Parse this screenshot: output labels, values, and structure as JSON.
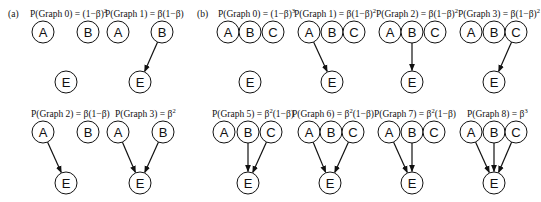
{
  "panels": [
    {
      "label": "(a)",
      "label_pos": [
        8,
        17
      ],
      "graphs": [
        {
          "title": "P(Graph 0) = (1−β)",
          "superscript": "2",
          "title_pos": [
            30,
            17
          ],
          "nodes": [
            {
              "id": "A",
              "x": 43,
              "y": 32
            },
            {
              "id": "B",
              "x": 88,
              "y": 32
            },
            {
              "id": "E",
              "x": 66,
              "y": 82
            }
          ],
          "edges": []
        },
        {
          "title": "P(Graph 1) = β(1−β)",
          "superscript": "",
          "title_pos": [
            105,
            17
          ],
          "nodes": [
            {
              "id": "A",
              "x": 118,
              "y": 32
            },
            {
              "id": "B",
              "x": 162,
              "y": 32
            },
            {
              "id": "E",
              "x": 140,
              "y": 82
            }
          ],
          "edges": [
            [
              "B",
              "E"
            ]
          ]
        },
        {
          "title": "P(Graph 2) = β(1−β)",
          "superscript": "",
          "title_pos": [
            31,
            117
          ],
          "nodes": [
            {
              "id": "A",
              "x": 43,
              "y": 132
            },
            {
              "id": "B",
              "x": 88,
              "y": 132
            },
            {
              "id": "E",
              "x": 66,
              "y": 183
            }
          ],
          "edges": [
            [
              "A",
              "E"
            ]
          ]
        },
        {
          "title": "P(Graph 3) = β",
          "superscript": "2",
          "title_pos": [
            115,
            117
          ],
          "nodes": [
            {
              "id": "A",
              "x": 118,
              "y": 132
            },
            {
              "id": "B",
              "x": 163,
              "y": 132
            },
            {
              "id": "E",
              "x": 140,
              "y": 183
            }
          ],
          "edges": [
            [
              "A",
              "E"
            ],
            [
              "B",
              "E"
            ]
          ]
        }
      ]
    },
    {
      "label": "(b)",
      "label_pos": [
        197,
        17
      ],
      "graphs": [
        {
          "title": "P(Graph 0) = (1−β)",
          "superscript": "3",
          "title_pos": [
            218,
            17
          ],
          "nodes": [
            {
              "id": "A",
              "x": 228,
              "y": 32
            },
            {
              "id": "B",
              "x": 250,
              "y": 32
            },
            {
              "id": "C",
              "x": 273,
              "y": 32
            },
            {
              "id": "E",
              "x": 250,
              "y": 82
            }
          ],
          "edges": []
        },
        {
          "title": "P(Graph 1) = β(1−β)",
          "superscript": "2",
          "title_pos": [
            294,
            17
          ],
          "nodes": [
            {
              "id": "A",
              "x": 309,
              "y": 32
            },
            {
              "id": "B",
              "x": 332,
              "y": 32
            },
            {
              "id": "C",
              "x": 354,
              "y": 32
            },
            {
              "id": "E",
              "x": 332,
              "y": 82
            }
          ],
          "edges": [
            [
              "A",
              "E"
            ]
          ]
        },
        {
          "title": "P(Graph 2) = β(1−β)",
          "superscript": "2",
          "title_pos": [
            376,
            17
          ],
          "nodes": [
            {
              "id": "A",
              "x": 390,
              "y": 32
            },
            {
              "id": "B",
              "x": 412,
              "y": 32
            },
            {
              "id": "C",
              "x": 435,
              "y": 32
            },
            {
              "id": "E",
              "x": 412,
              "y": 82
            }
          ],
          "edges": [
            [
              "B",
              "E"
            ]
          ]
        },
        {
          "title": "P(Graph 3) = β(1−β)",
          "superscript": "2",
          "title_pos": [
            458,
            17
          ],
          "nodes": [
            {
              "id": "A",
              "x": 471,
              "y": 32
            },
            {
              "id": "B",
              "x": 494,
              "y": 32
            },
            {
              "id": "C",
              "x": 516,
              "y": 32
            },
            {
              "id": "E",
              "x": 494,
              "y": 82
            }
          ],
          "edges": [
            [
              "C",
              "E"
            ]
          ]
        },
        {
          "title": "P(Graph 5) = β",
          "superscript": "2",
          "suffix": "(1−β)",
          "title_pos": [
            212,
            117
          ],
          "nodes": [
            {
              "id": "A",
              "x": 224,
              "y": 132
            },
            {
              "id": "B",
              "x": 248,
              "y": 132
            },
            {
              "id": "C",
              "x": 271,
              "y": 132
            },
            {
              "id": "E",
              "x": 248,
              "y": 183
            }
          ],
          "edges": [
            [
              "B",
              "E"
            ],
            [
              "C",
              "E"
            ]
          ]
        },
        {
          "title": "P(Graph 6) = β",
          "superscript": "2",
          "suffix": "(1−β)",
          "title_pos": [
            292,
            117
          ],
          "nodes": [
            {
              "id": "A",
              "x": 309,
              "y": 132
            },
            {
              "id": "B",
              "x": 331,
              "y": 132
            },
            {
              "id": "C",
              "x": 353,
              "y": 132
            },
            {
              "id": "E",
              "x": 330,
              "y": 183
            }
          ],
          "edges": [
            [
              "A",
              "E"
            ],
            [
              "C",
              "E"
            ]
          ]
        },
        {
          "title": "P(Graph 7) = β",
          "superscript": "2",
          "suffix": "(1−β)",
          "title_pos": [
            374,
            117
          ],
          "nodes": [
            {
              "id": "A",
              "x": 389,
              "y": 132
            },
            {
              "id": "B",
              "x": 412,
              "y": 132
            },
            {
              "id": "C",
              "x": 434,
              "y": 132
            },
            {
              "id": "E",
              "x": 412,
              "y": 183
            }
          ],
          "edges": [
            [
              "A",
              "E"
            ],
            [
              "B",
              "E"
            ]
          ]
        },
        {
          "title": "P(Graph 8) = β",
          "superscript": "3",
          "title_pos": [
            467,
            117
          ],
          "nodes": [
            {
              "id": "A",
              "x": 471,
              "y": 132
            },
            {
              "id": "B",
              "x": 494,
              "y": 132
            },
            {
              "id": "C",
              "x": 516,
              "y": 132
            },
            {
              "id": "E",
              "x": 494,
              "y": 183
            }
          ],
          "edges": [
            [
              "A",
              "E"
            ],
            [
              "B",
              "E"
            ],
            [
              "C",
              "E"
            ]
          ]
        }
      ]
    }
  ],
  "style": {
    "node_radius": 11,
    "stroke_color": "#111111",
    "background": "#ffffff"
  }
}
